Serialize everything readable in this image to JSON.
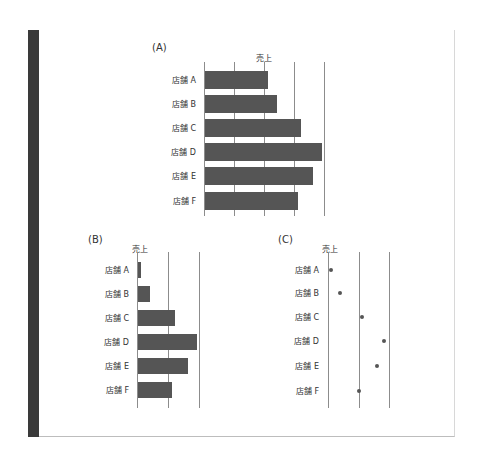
{
  "figure": {
    "panels": [
      "(A)",
      "(B)",
      "(C)"
    ]
  },
  "chart_data": [
    {
      "panel": "(A)",
      "type": "bar",
      "orientation": "horizontal",
      "title": "",
      "xlabel": "売上",
      "ylabel": "",
      "categories": [
        "店舗 A",
        "店舗 B",
        "店舗 C",
        "店舗 D",
        "店舗 E",
        "店舗 F"
      ],
      "values": [
        21,
        24,
        32,
        39,
        36,
        31
      ],
      "xlim": [
        0,
        40
      ],
      "grid": true,
      "tick_labels_shown": false,
      "note": "values in relative units (gridline spacing = 10); axis starts at zero"
    },
    {
      "panel": "(B)",
      "type": "bar",
      "orientation": "horizontal",
      "title": "",
      "xlabel": "売上",
      "ylabel": "",
      "categories": [
        "店舗 A",
        "店舗 B",
        "店舗 C",
        "店舗 D",
        "店舗 E",
        "店舗 F"
      ],
      "values": [
        21,
        24,
        32,
        39,
        36,
        31
      ],
      "xlim": [
        20,
        40
      ],
      "grid": true,
      "tick_labels_shown": false,
      "note": "same data with truncated axis starting at 20"
    },
    {
      "panel": "(C)",
      "type": "scatter",
      "title": "",
      "xlabel": "売上",
      "ylabel": "",
      "categories": [
        "店舗 A",
        "店舗 B",
        "店舗 C",
        "店舗 D",
        "店舗 E",
        "店舗 F"
      ],
      "values": [
        21,
        24,
        31,
        38.5,
        36,
        30
      ],
      "xlim": [
        20,
        40
      ],
      "grid": true,
      "tick_labels_shown": false,
      "note": "dot plot of same data, axis starting at 20"
    }
  ]
}
